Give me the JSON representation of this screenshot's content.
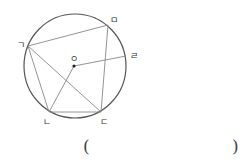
{
  "diagram": {
    "center": {
      "label": "ㅇ",
      "x": 74,
      "y": 66
    },
    "circle": {
      "cx": 75,
      "cy": 66,
      "rx": 51,
      "ry": 52
    },
    "points": {
      "g": {
        "label": "ㄱ",
        "x": 28,
        "y": 46,
        "lx": 17,
        "ly": 48
      },
      "n": {
        "label": "ㄴ",
        "x": 49,
        "y": 112,
        "lx": 43,
        "ly": 125
      },
      "d": {
        "label": "ㄷ",
        "x": 101,
        "y": 112,
        "lx": 100,
        "ly": 125
      },
      "r": {
        "label": "ㄹ",
        "x": 126,
        "y": 56,
        "lx": 130,
        "ly": 59
      },
      "m": {
        "label": "ㅁ",
        "x": 108,
        "y": 25,
        "lx": 110,
        "ly": 23
      }
    },
    "segments": [
      [
        "g",
        "m"
      ],
      [
        "g",
        "n"
      ],
      [
        "g",
        "d"
      ],
      [
        "n",
        "d"
      ],
      [
        "m",
        "d"
      ],
      [
        "center",
        "n"
      ],
      [
        "center",
        "r"
      ]
    ]
  },
  "answer": {
    "open_paren": "(",
    "close_paren": ")",
    "value": ""
  }
}
